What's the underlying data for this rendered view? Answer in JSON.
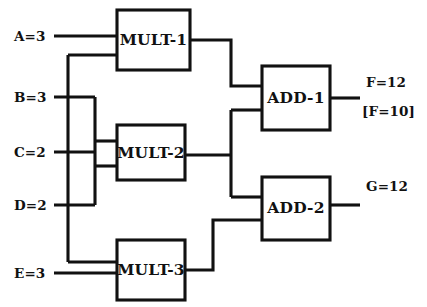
{
  "diagram": {
    "type": "dataflow-circuit-diagram",
    "title": "",
    "canvas": {
      "width": 427,
      "height": 307,
      "background": "#ffffff"
    },
    "colors": {
      "stroke": "#111111",
      "fill": "#ffffff"
    },
    "inputs": [
      {
        "id": "A",
        "label": "A=3",
        "name": "A",
        "value": 3,
        "x": 14,
        "y": 36,
        "wire_y": 36
      },
      {
        "id": "B",
        "label": "B=3",
        "name": "B",
        "value": 3,
        "x": 14,
        "y": 97,
        "wire_y": 97
      },
      {
        "id": "C",
        "label": "C=2",
        "name": "C",
        "value": 2,
        "x": 14,
        "y": 152,
        "wire_y": 152
      },
      {
        "id": "D",
        "label": "D=2",
        "name": "D",
        "value": 2,
        "x": 14,
        "y": 205,
        "wire_y": 205
      },
      {
        "id": "E",
        "label": "E=3",
        "name": "E",
        "value": 3,
        "x": 14,
        "y": 273,
        "wire_y": 273
      }
    ],
    "gates": [
      {
        "id": "MULT-1",
        "label": "MULT-1",
        "op": "multiply",
        "x": 117,
        "y": 10,
        "w": 73,
        "h": 60,
        "inputs": [
          "A",
          "B"
        ],
        "output": 9
      },
      {
        "id": "MULT-2",
        "label": "MULT-2",
        "op": "multiply",
        "x": 117,
        "y": 125,
        "w": 68,
        "h": 55,
        "inputs": [
          "C",
          "D"
        ],
        "output": 4
      },
      {
        "id": "MULT-3",
        "label": "MULT-3",
        "op": "multiply",
        "x": 117,
        "y": 240,
        "w": 68,
        "h": 60,
        "inputs": [
          "B",
          "E"
        ],
        "output": 9
      },
      {
        "id": "ADD-1",
        "label": "ADD-1",
        "op": "add",
        "x": 262,
        "y": 66,
        "w": 68,
        "h": 64,
        "inputs": [
          "MULT-1",
          "MULT-2"
        ],
        "output": 12
      },
      {
        "id": "ADD-2",
        "label": "ADD-2",
        "op": "add",
        "x": 262,
        "y": 177,
        "w": 68,
        "h": 63,
        "inputs": [
          "MULT-2",
          "MULT-3"
        ],
        "output": 12
      }
    ],
    "outputs": [
      {
        "id": "F",
        "label": "F=12",
        "alt_label": "[F=10]",
        "name": "F",
        "value": 12,
        "alt_value": 10,
        "source": "ADD-1",
        "x": 364,
        "y": 82,
        "alt_y": 110,
        "wire_y": 98
      },
      {
        "id": "G",
        "label": "G=12",
        "name": "G",
        "value": 12,
        "source": "ADD-2",
        "x": 364,
        "y": 186,
        "wire_y": 205
      }
    ],
    "buses": [
      {
        "id": "bus-B",
        "x": 68,
        "from_y": 55,
        "to_y": 262,
        "carries": "B"
      },
      {
        "id": "bus-CD",
        "x": 95,
        "from_y": 97,
        "to_y": 205,
        "carries": "C,D"
      },
      {
        "id": "bus-MULT2-out",
        "x": 231,
        "from_y": 118,
        "to_y": 197,
        "carries": "MULT-2"
      }
    ]
  }
}
